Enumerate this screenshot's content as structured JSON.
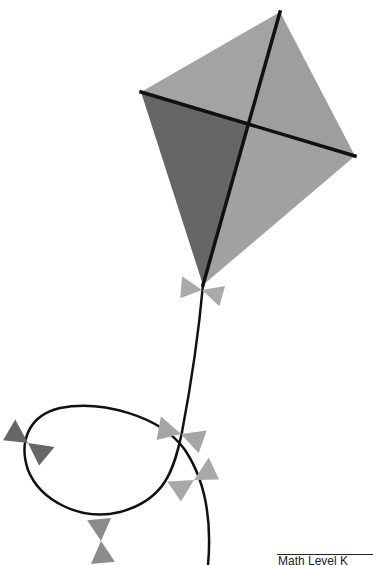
{
  "illustration": {
    "subject": "kite with bow-tied tail",
    "colors": {
      "kite_light": "#a5a5a5",
      "kite_mid": "#9c9c9c",
      "kite_dark": "#666666",
      "frame": "#111111",
      "string": "#111111",
      "bow_light": "#a8a8a8",
      "bow_dark": "#6a6a6a"
    },
    "bow_count": 6
  },
  "footer": {
    "label": "Math Level K"
  }
}
